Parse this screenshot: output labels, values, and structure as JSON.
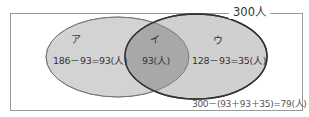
{
  "diagram": {
    "type": "venn",
    "universe": {
      "label": "300人",
      "total": 300
    },
    "sets": {
      "left": {
        "region_label": "ア",
        "calculation": "186－93=93(人)",
        "set_total": 186,
        "only_count": 93
      },
      "intersection": {
        "region_label": "イ",
        "calculation": "93(人)",
        "count": 93
      },
      "right": {
        "region_label": "ウ",
        "calculation": "128－93=35(人)",
        "set_total": 128,
        "only_count": 35
      }
    },
    "outside": {
      "calculation": "300－(93＋93＋35)=79(人)",
      "count": 79
    },
    "colors": {
      "frame": "#9a9a9a",
      "left_fill": "#d3d3d3",
      "right_fill": "#d0d0d0",
      "intersection_fill": "#a8a8a8",
      "left_stroke": "#6e6e6e",
      "right_stroke": "#333333",
      "text": "#333333"
    }
  }
}
